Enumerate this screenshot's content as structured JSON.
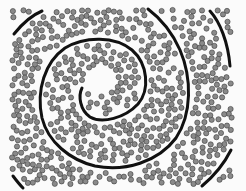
{
  "figure": {
    "title": "",
    "background": "#f7f7f7",
    "panel_bg": "#fbfbfb",
    "line_color": "#111111",
    "dot_fill": "#8a8a8a",
    "dot_stroke": "#3a3a3a",
    "spiral_path": "M82,88 C78,96 80,110 90,117 C102,124 125,118 138,104 C150,90 148,64 132,50 C115,36 85,36 65,48 C45,62 36,90 42,118 C48,142 70,160 95,166 C125,172 158,162 176,138 C192,114 192,78 180,50 C172,32 160,18 148,9",
    "outer_arcs": [
      "M14,34 C22,24 30,16 42,11",
      "M210,11 C220,22 228,42 230,66",
      "M231,150 C224,164 214,176 202,186",
      "M13,176 C16,180 19,184 23,188"
    ],
    "dots": {
      "count": 620,
      "radius": 2.6,
      "seed": 7,
      "region": [
        12,
        10,
        232,
        184
      ]
    }
  }
}
